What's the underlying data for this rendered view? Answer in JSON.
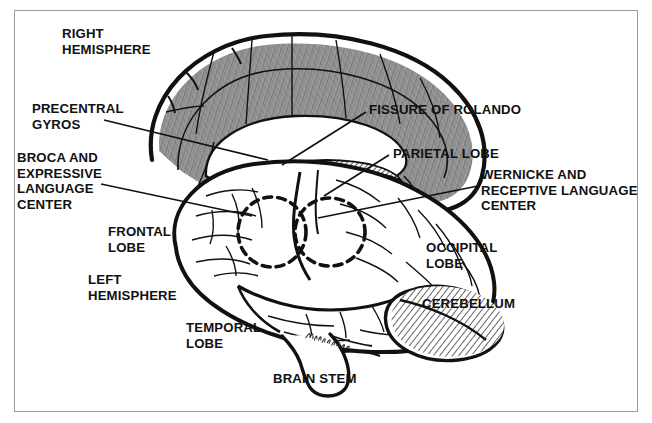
{
  "figure": {
    "border_color": "#9b9b9b",
    "ink_color": "#111111",
    "paper_color": "#ffffff",
    "shaded_cortex_color": "#8d8d8d",
    "signature": "Nell Fricke"
  },
  "labels": [
    {
      "id": "right-hemisphere",
      "lines": [
        "RIGHT",
        "HEMISPHERE"
      ],
      "x": 62,
      "y": 26,
      "align": "left",
      "leader": false
    },
    {
      "id": "precentral-gyros",
      "lines": [
        "PRECENTRAL",
        "GYROS"
      ],
      "x": 32,
      "y": 101,
      "align": "left",
      "leader": true
    },
    {
      "id": "broca-center",
      "lines": [
        "BROCA AND",
        "EXPRESSIVE",
        "LANGUAGE",
        "CENTER"
      ],
      "x": 17,
      "y": 150,
      "align": "left",
      "leader": true
    },
    {
      "id": "frontal-lobe",
      "lines": [
        "FRONTAL",
        "LOBE"
      ],
      "x": 108,
      "y": 224,
      "align": "left",
      "leader": false
    },
    {
      "id": "left-hemisphere",
      "lines": [
        "LEFT",
        "HEMISPHERE"
      ],
      "x": 88,
      "y": 272,
      "align": "left",
      "leader": false
    },
    {
      "id": "temporal-lobe",
      "lines": [
        "TEMPORAL",
        "LOBE"
      ],
      "x": 186,
      "y": 320,
      "align": "left",
      "leader": false
    },
    {
      "id": "brain-stem",
      "lines": [
        "BRAIN STEM"
      ],
      "x": 273,
      "y": 371,
      "align": "left",
      "leader": false
    },
    {
      "id": "fissure-of-rolando",
      "lines": [
        "FISSURE OF ROLANDO"
      ],
      "x": 369,
      "y": 102,
      "align": "left",
      "leader": true
    },
    {
      "id": "parietal-lobe",
      "lines": [
        "PARIETAL LOBE"
      ],
      "x": 393,
      "y": 146,
      "align": "left",
      "leader": true
    },
    {
      "id": "wernicke-center",
      "lines": [
        "WERNICKE AND",
        "RECEPTIVE LANGUAGE",
        "CENTER"
      ],
      "x": 481,
      "y": 167,
      "align": "left",
      "leader": true
    },
    {
      "id": "occipital-lobe",
      "lines": [
        "OCCIPITAL",
        "LOBE"
      ],
      "x": 426,
      "y": 240,
      "align": "left",
      "leader": false
    },
    {
      "id": "cerebellum",
      "lines": [
        "CEREBELLUM"
      ],
      "x": 422,
      "y": 296,
      "align": "left",
      "leader": false
    }
  ],
  "leader_lines": [
    {
      "id": "leader-precentral-gyros",
      "from": [
        104,
        120
      ],
      "to": [
        268,
        160
      ]
    },
    {
      "id": "leader-broca",
      "from": [
        101,
        184
      ],
      "to": [
        252,
        216
      ]
    },
    {
      "id": "leader-fissure-rolando",
      "from": [
        366,
        112
      ],
      "to": [
        282,
        165
      ]
    },
    {
      "id": "leader-parietal-lobe",
      "from": [
        389,
        155
      ],
      "to": [
        324,
        196
      ]
    },
    {
      "id": "leader-wernicke",
      "from": [
        478,
        186
      ],
      "to": [
        318,
        218
      ]
    }
  ],
  "regions": [
    {
      "id": "right-hemisphere-medial",
      "shading": "grey-pencil"
    },
    {
      "id": "corpus-callosum",
      "shading": "white"
    },
    {
      "id": "corpus-callosum-hatch",
      "shading": "cross-hatch"
    },
    {
      "id": "left-hemisphere-lateral",
      "shading": "white"
    },
    {
      "id": "cerebellum-arbor-vitae",
      "shading": "diagonal-hatch"
    },
    {
      "id": "brain-stem-region",
      "shading": "white"
    },
    {
      "id": "broca-area-circle",
      "shading": "dashed-outline"
    },
    {
      "id": "wernicke-area-circle",
      "shading": "dashed-outline"
    }
  ]
}
